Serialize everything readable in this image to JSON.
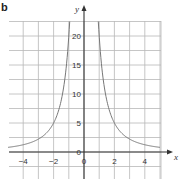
{
  "panel_label": "b",
  "chart_data": {
    "type": "line",
    "title": "",
    "xlabel": "x",
    "ylabel": "y",
    "xlim": [
      -5,
      5.1
    ],
    "ylim": [
      -4.5,
      22.5
    ],
    "grid": true,
    "x_ticks": [
      -4,
      -2,
      0,
      2,
      4
    ],
    "x_tick_labels": [
      "-4",
      "-2",
      "0",
      "2",
      "4"
    ],
    "y_ticks": [
      0,
      5,
      10,
      15,
      20
    ],
    "y_tick_labels": [
      "0",
      "5",
      "10",
      "15",
      "20"
    ],
    "series": [
      {
        "name": "y = 20/x^2 (approx.)",
        "x": [
          -5,
          -4,
          -3,
          -2,
          -1.5,
          -1.2,
          -1,
          1,
          1.2,
          1.5,
          2,
          3,
          4,
          5
        ],
        "y": [
          0.8,
          1.25,
          2.2,
          5,
          8.9,
          13.9,
          20,
          20,
          13.9,
          8.9,
          5,
          2.2,
          1.25,
          0.8
        ]
      }
    ],
    "color": "#777777"
  }
}
